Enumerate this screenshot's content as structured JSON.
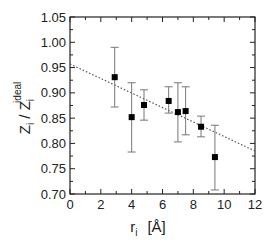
{
  "chart_data": {
    "type": "scatter",
    "title": "",
    "xlabel": "r_i [Å]",
    "ylabel": "Z_i / Z_i^ideal",
    "xlabel_parts": {
      "main": "r",
      "sub": "i",
      "unit": "[Å]"
    },
    "ylabel_parts": {
      "main1": "Z",
      "sub1": "i",
      "slash": " / ",
      "main2": "Z",
      "sub2": "i",
      "sup2": "ideal"
    },
    "xlim": [
      0,
      12
    ],
    "ylim": [
      0.7,
      1.05
    ],
    "x_ticks": [
      0,
      2,
      4,
      6,
      8,
      10,
      12
    ],
    "x_tick_labels": [
      "0",
      "2",
      "4",
      "6",
      "8",
      "10",
      "12"
    ],
    "y_ticks": [
      0.7,
      0.75,
      0.8,
      0.85,
      0.9,
      0.95,
      1.0,
      1.05
    ],
    "y_tick_labels": [
      "0.70",
      "0.75",
      "0.80",
      "0.85",
      "0.90",
      "0.95",
      "1.00",
      "1.05"
    ],
    "grid": false,
    "legend": null,
    "series": [
      {
        "name": "data",
        "marker": "square",
        "color": "#000000",
        "x": [
          2.9,
          4.0,
          4.8,
          6.4,
          7.0,
          7.5,
          8.5,
          9.4
        ],
        "y": [
          0.931,
          0.852,
          0.876,
          0.884,
          0.862,
          0.864,
          0.833,
          0.773
        ],
        "y_err_low": [
          0.872,
          0.783,
          0.846,
          0.86,
          0.803,
          0.817,
          0.813,
          0.708
        ],
        "y_err_high": [
          0.99,
          0.92,
          0.906,
          0.912,
          0.92,
          0.912,
          0.854,
          0.836
        ]
      },
      {
        "name": "linear fit",
        "style": "dotted",
        "color": "#555555",
        "x": [
          0,
          12
        ],
        "y": [
          0.957,
          0.785
        ]
      }
    ]
  }
}
